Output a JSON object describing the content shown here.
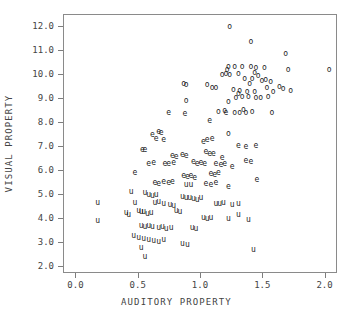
{
  "chart_data": {
    "type": "scatter",
    "title": "",
    "xlabel": "AUDITORY PROPERTY",
    "ylabel": "VISUAL PROPERTY",
    "xlim": [
      -0.1,
      2.1
    ],
    "ylim": [
      1.7,
      12.5
    ],
    "xticks": [
      "0.0",
      "0.5",
      "1.0",
      "1.5",
      "2.0"
    ],
    "xtick_values": [
      0.0,
      0.5,
      1.0,
      1.5,
      2.0
    ],
    "yticks": [
      "2.0",
      "3.0",
      "4.0",
      "5.0",
      "6.0",
      "7.0",
      "8.0",
      "9.0",
      "10.0",
      "11.0",
      "12.0"
    ],
    "ytick_values": [
      2.0,
      3.0,
      4.0,
      5.0,
      6.0,
      7.0,
      8.0,
      9.0,
      10.0,
      11.0,
      12.0
    ],
    "grid": false,
    "legend": "none",
    "marker_style": "text-glyph",
    "series": [
      {
        "name": "o",
        "marker": "o",
        "points": [
          [
            1.23,
            12.02
          ],
          [
            1.4,
            11.36
          ],
          [
            1.68,
            10.87
          ],
          [
            1.22,
            10.35
          ],
          [
            1.27,
            10.35
          ],
          [
            1.33,
            10.35
          ],
          [
            1.4,
            10.35
          ],
          [
            1.44,
            10.28
          ],
          [
            1.51,
            10.3
          ],
          [
            1.7,
            10.2
          ],
          [
            2.03,
            10.2
          ],
          [
            1.21,
            10.2
          ],
          [
            1.17,
            10.0
          ],
          [
            1.23,
            9.98
          ],
          [
            1.2,
            10.05
          ],
          [
            1.46,
            9.97
          ],
          [
            1.35,
            9.85
          ],
          [
            1.41,
            9.82
          ],
          [
            1.52,
            9.8
          ],
          [
            1.56,
            9.72
          ],
          [
            1.49,
            9.75
          ],
          [
            1.09,
            9.47
          ],
          [
            1.12,
            9.45
          ],
          [
            1.05,
            9.6
          ],
          [
            0.86,
            9.62
          ],
          [
            0.88,
            9.58
          ],
          [
            1.26,
            9.38
          ],
          [
            1.31,
            9.35
          ],
          [
            1.37,
            9.3
          ],
          [
            1.43,
            9.28
          ],
          [
            1.63,
            9.5
          ],
          [
            1.66,
            9.42
          ],
          [
            1.72,
            9.33
          ],
          [
            1.58,
            9.3
          ],
          [
            0.88,
            8.93
          ],
          [
            1.28,
            9.05
          ],
          [
            1.33,
            9.1
          ],
          [
            1.38,
            9.08
          ],
          [
            1.22,
            8.88
          ],
          [
            1.44,
            9.02
          ],
          [
            1.48,
            9.05
          ],
          [
            1.54,
            9.08
          ],
          [
            1.14,
            8.45
          ],
          [
            1.19,
            8.48
          ],
          [
            1.27,
            8.43
          ],
          [
            1.31,
            8.4
          ],
          [
            1.36,
            8.42
          ],
          [
            1.41,
            8.45
          ],
          [
            1.57,
            8.43
          ],
          [
            1.34,
            8.55
          ],
          [
            1.22,
            7.55
          ],
          [
            1.3,
            9.2
          ],
          [
            1.39,
            9.62
          ],
          [
            1.53,
            9.45
          ],
          [
            1.43,
            10.1
          ],
          [
            1.3,
            10.05
          ]
        ]
      },
      {
        "name": "e",
        "marker": "e",
        "points": [
          [
            0.74,
            8.42
          ],
          [
            0.87,
            8.37
          ],
          [
            1.07,
            8.1
          ],
          [
            0.61,
            7.48
          ],
          [
            0.66,
            7.62
          ],
          [
            0.68,
            7.58
          ],
          [
            0.64,
            7.32
          ],
          [
            0.7,
            7.28
          ],
          [
            0.53,
            6.85
          ],
          [
            0.55,
            6.85
          ],
          [
            1.02,
            7.2
          ],
          [
            1.05,
            7.3
          ],
          [
            1.09,
            7.32
          ],
          [
            1.3,
            7.05
          ],
          [
            1.36,
            6.98
          ],
          [
            1.44,
            7.02
          ],
          [
            1.04,
            6.78
          ],
          [
            1.07,
            6.7
          ],
          [
            1.1,
            6.72
          ],
          [
            0.77,
            6.62
          ],
          [
            0.8,
            6.58
          ],
          [
            0.71,
            6.3
          ],
          [
            0.74,
            6.28
          ],
          [
            0.78,
            6.33
          ],
          [
            0.94,
            6.35
          ],
          [
            0.97,
            6.3
          ],
          [
            1.0,
            6.32
          ],
          [
            1.03,
            6.28
          ],
          [
            1.12,
            6.3
          ],
          [
            1.16,
            6.25
          ],
          [
            1.19,
            6.28
          ],
          [
            1.36,
            6.42
          ],
          [
            1.4,
            6.35
          ],
          [
            0.47,
            5.92
          ],
          [
            0.86,
            5.8
          ],
          [
            0.89,
            5.75
          ],
          [
            0.92,
            5.78
          ],
          [
            0.95,
            5.72
          ],
          [
            1.08,
            5.88
          ],
          [
            1.11,
            5.82
          ],
          [
            1.14,
            5.9
          ],
          [
            0.63,
            5.48
          ],
          [
            0.66,
            5.45
          ],
          [
            0.7,
            5.52
          ],
          [
            0.74,
            5.48
          ],
          [
            0.77,
            5.55
          ],
          [
            1.04,
            5.45
          ],
          [
            1.08,
            5.4
          ],
          [
            1.12,
            5.48
          ],
          [
            1.22,
            5.32
          ],
          [
            1.45,
            5.6
          ],
          [
            0.85,
            6.65
          ],
          [
            0.88,
            6.6
          ],
          [
            1.17,
            6.55
          ],
          [
            1.25,
            6.18
          ],
          [
            0.58,
            6.28
          ],
          [
            0.62,
            6.32
          ],
          [
            1.2,
            8.4
          ]
        ]
      },
      {
        "name": "u",
        "marker": "u",
        "points": [
          [
            0.17,
            4.68
          ],
          [
            0.17,
            3.92
          ],
          [
            0.44,
            5.1
          ],
          [
            0.47,
            4.68
          ],
          [
            0.5,
            4.32
          ],
          [
            0.52,
            4.28
          ],
          [
            0.54,
            4.3
          ],
          [
            0.57,
            4.22
          ],
          [
            0.6,
            4.25
          ],
          [
            0.63,
            4.65
          ],
          [
            0.66,
            4.7
          ],
          [
            0.7,
            4.62
          ],
          [
            0.55,
            5.08
          ],
          [
            0.58,
            4.98
          ],
          [
            0.61,
            4.95
          ],
          [
            0.64,
            5.0
          ],
          [
            0.85,
            4.92
          ],
          [
            0.88,
            4.88
          ],
          [
            0.91,
            4.85
          ],
          [
            0.94,
            4.82
          ],
          [
            0.97,
            4.8
          ],
          [
            1.0,
            4.85
          ],
          [
            1.12,
            4.62
          ],
          [
            1.15,
            4.6
          ],
          [
            1.18,
            4.65
          ],
          [
            1.25,
            4.58
          ],
          [
            1.3,
            4.62
          ],
          [
            1.38,
            3.95
          ],
          [
            0.52,
            3.7
          ],
          [
            0.55,
            3.68
          ],
          [
            0.58,
            3.72
          ],
          [
            0.61,
            3.65
          ],
          [
            0.66,
            3.62
          ],
          [
            0.69,
            3.68
          ],
          [
            0.72,
            3.58
          ],
          [
            0.76,
            3.6
          ],
          [
            0.93,
            3.62
          ],
          [
            0.96,
            3.58
          ],
          [
            1.02,
            4.02
          ],
          [
            1.05,
            3.98
          ],
          [
            1.08,
            4.05
          ],
          [
            0.46,
            3.28
          ],
          [
            0.5,
            3.22
          ],
          [
            0.54,
            3.15
          ],
          [
            0.58,
            3.1
          ],
          [
            0.62,
            3.08
          ],
          [
            0.66,
            3.05
          ],
          [
            0.7,
            3.12
          ],
          [
            0.85,
            2.95
          ],
          [
            0.89,
            2.92
          ],
          [
            1.42,
            2.72
          ],
          [
            0.52,
            2.78
          ],
          [
            0.55,
            2.42
          ],
          [
            0.8,
            4.32
          ],
          [
            0.83,
            4.28
          ],
          [
            0.75,
            4.58
          ],
          [
            0.78,
            4.52
          ],
          [
            0.4,
            4.25
          ],
          [
            0.42,
            4.18
          ],
          [
            1.22,
            3.98
          ],
          [
            1.3,
            4.18
          ],
          [
            0.88,
            5.4
          ],
          [
            0.92,
            5.42
          ]
        ]
      }
    ]
  }
}
